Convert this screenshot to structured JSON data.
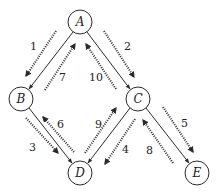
{
  "diagram": {
    "type": "graph-traversal",
    "nodes": [
      {
        "id": "A",
        "label": "A",
        "x": 80,
        "y": 22
      },
      {
        "id": "B",
        "label": "B",
        "x": 21,
        "y": 99
      },
      {
        "id": "C",
        "label": "C",
        "x": 138,
        "y": 99
      },
      {
        "id": "D",
        "label": "D",
        "x": 80,
        "y": 173
      },
      {
        "id": "E",
        "label": "E",
        "x": 197,
        "y": 173
      }
    ],
    "edges": [
      {
        "from": "A",
        "to": "B"
      },
      {
        "from": "A",
        "to": "C"
      },
      {
        "from": "B",
        "to": "D"
      },
      {
        "from": "C",
        "to": "D"
      },
      {
        "from": "C",
        "to": "E"
      }
    ],
    "steps": [
      {
        "label": "1",
        "from": "A",
        "to": "B"
      },
      {
        "label": "2",
        "from": "A",
        "to": "C"
      },
      {
        "label": "3",
        "from": "B",
        "to": "D"
      },
      {
        "label": "4",
        "from": "C",
        "to": "D"
      },
      {
        "label": "5",
        "from": "C",
        "to": "E"
      },
      {
        "label": "6",
        "from": "D",
        "to": "B"
      },
      {
        "label": "7",
        "from": "B",
        "to": "A"
      },
      {
        "label": "8",
        "from": "E",
        "to": "C"
      },
      {
        "label": "9",
        "from": "D",
        "to": "C"
      },
      {
        "label": "10",
        "from": "C",
        "to": "A"
      }
    ]
  }
}
